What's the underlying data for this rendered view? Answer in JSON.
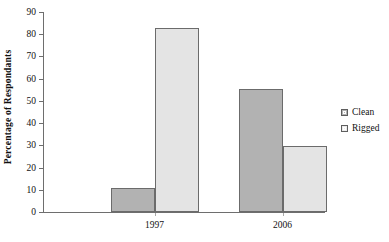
{
  "chart_data": {
    "type": "bar",
    "title": "",
    "xlabel": "",
    "ylabel": "Percentage of Respondants",
    "categories": [
      "1997",
      "2006"
    ],
    "series": [
      {
        "name": "Clean",
        "values": [
          11,
          55.5
        ],
        "color": "#b2b2b2"
      },
      {
        "name": "Rigged",
        "values": [
          83,
          29.5
        ],
        "color": "#e4e4e4"
      }
    ],
    "ylim": [
      0,
      90
    ],
    "ytick_step": 10,
    "yticks": [
      "0",
      "10",
      "20",
      "30",
      "40",
      "50",
      "60",
      "70",
      "80",
      "90"
    ],
    "grid": false,
    "legend_position": "right",
    "legend_entries": [
      "Clean",
      "Rigged"
    ]
  }
}
